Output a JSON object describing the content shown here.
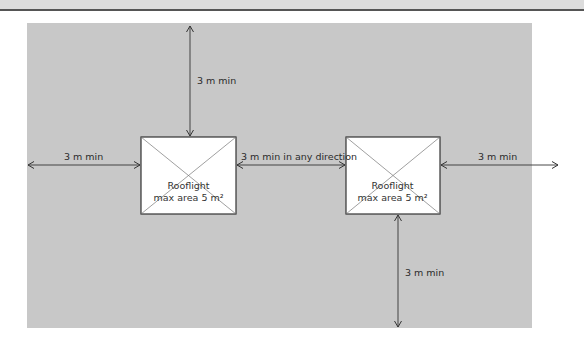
{
  "diagram": {
    "title": "",
    "colors": {
      "background": "#ffffff",
      "panel": "#c8c8c8",
      "rooflight_fill": "#ffffff",
      "lines": "#333333",
      "text": "#2b2b2b"
    },
    "rooflights": [
      {
        "label_line1": "Rooflight",
        "label_line2": "max area 5 m²"
      },
      {
        "label_line1": "Rooflight",
        "label_line2": "max area 5 m²"
      }
    ],
    "dimensions": {
      "top": "3 m min",
      "left": "3 m min",
      "between": "3 m min in any direction",
      "right": "3 m min",
      "bottom": "3 m min"
    }
  }
}
